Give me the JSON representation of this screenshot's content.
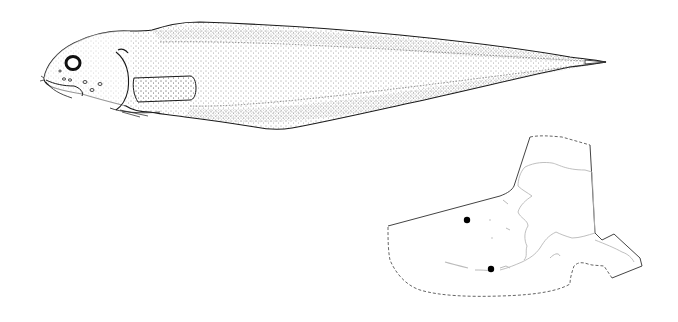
{
  "figure": {
    "background": "#ffffff",
    "ink_color": "#1a1a1a",
    "coast_color": "#b8b8b8",
    "boundary_color": "#555555",
    "fish_illustration": {
      "subject": "snailfish (stippled lateral view)",
      "orientation": "facing left"
    },
    "distribution_map": {
      "region": "Alaska",
      "locality_dots": [
        {
          "x": 467,
          "y": 220
        },
        {
          "x": 491,
          "y": 269
        }
      ]
    }
  }
}
